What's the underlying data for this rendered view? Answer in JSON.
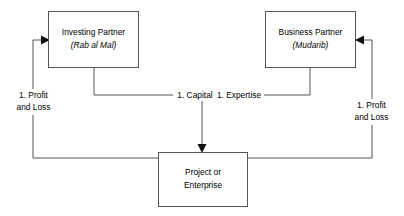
{
  "diagram": {
    "style": {
      "line_color": "#555555",
      "box_fill": "#ffffff",
      "text_color": "#000000",
      "background": "#ffffff"
    },
    "nodes": [
      {
        "id": "investing-partner",
        "line1": "Investing Partner",
        "line2": "(Rab al Mal)",
        "line2_italic": true
      },
      {
        "id": "business-partner",
        "line1": "Business Partner",
        "line2": "(Mudarib)",
        "line2_italic": true
      },
      {
        "id": "project-enterprise",
        "line1": "Project or",
        "line2": "Enterprise",
        "line2_italic": false
      }
    ],
    "edges": [
      {
        "id": "capital",
        "label": "1. Capital",
        "from": "investing-partner",
        "to": "project-enterprise"
      },
      {
        "id": "expertise",
        "label": "1. Expertise",
        "from": "business-partner",
        "to": "project-enterprise"
      },
      {
        "id": "profit-loss-left",
        "label_line1": "1. Profit",
        "label_line2": "and Loss",
        "from": "project-enterprise",
        "to": "investing-partner"
      },
      {
        "id": "profit-loss-right",
        "label_line1": "1. Profit",
        "label_line2": "and Loss",
        "from": "project-enterprise",
        "to": "business-partner"
      }
    ]
  }
}
